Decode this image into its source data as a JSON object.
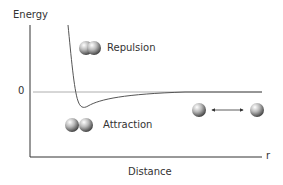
{
  "diagram": {
    "y_axis_label": "Energy",
    "x_axis_label": "Distance",
    "x_axis_end_label": "r",
    "zero_label": "0",
    "repulsion_label": "Repulsion",
    "attraction_label": "Attraction",
    "curve": {
      "points": [
        [
          68,
          25
        ],
        [
          72,
          60
        ],
        [
          75,
          85
        ],
        [
          78,
          100
        ],
        [
          82,
          108
        ],
        [
          90,
          105
        ],
        [
          110,
          98
        ],
        [
          140,
          94
        ],
        [
          185,
          92
        ],
        [
          262,
          92
        ]
      ],
      "minimum": [
        82,
        108
      ]
    },
    "atoms": [
      {
        "name": "repulsion-pair",
        "type": "overlapping"
      },
      {
        "name": "attraction-pair",
        "type": "touching"
      },
      {
        "name": "separated-pair",
        "type": "separated",
        "arrow": "double"
      }
    ]
  }
}
